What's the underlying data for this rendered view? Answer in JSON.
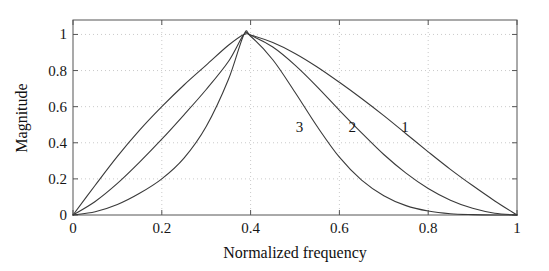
{
  "chart_data": {
    "type": "line",
    "title": "",
    "xlabel": "Normalized frequency",
    "ylabel": "Magnitude",
    "xlim": [
      0,
      1
    ],
    "ylim": [
      0,
      1.08
    ],
    "xticks": [
      "0",
      "0.2",
      "0.4",
      "0.6",
      "0.8",
      "1"
    ],
    "xtick_values": [
      0,
      0.2,
      0.4,
      0.6,
      0.8,
      1
    ],
    "yticks": [
      "0",
      "0.2",
      "0.4",
      "0.6",
      "0.8",
      "1"
    ],
    "ytick_values": [
      0,
      0.2,
      0.4,
      0.6,
      0.8,
      1
    ],
    "grid": true,
    "grid_style": "dotted",
    "legend": "inline curve annotations",
    "line_color": "#3a3a3a",
    "peak_frequency": 0.385,
    "peak_magnitude": 1.0,
    "x": [
      0,
      0.05,
      0.1,
      0.15,
      0.2,
      0.25,
      0.3,
      0.35,
      0.385,
      0.4,
      0.45,
      0.5,
      0.55,
      0.6,
      0.65,
      0.7,
      0.75,
      0.8,
      0.85,
      0.9,
      0.95,
      1
    ],
    "series": [
      {
        "name": "1",
        "label": "1",
        "label_x": 0.748,
        "label_y": 0.487,
        "values": [
          0.0,
          0.165,
          0.325,
          0.47,
          0.6,
          0.72,
          0.83,
          0.94,
          1.0,
          0.997,
          0.955,
          0.895,
          0.82,
          0.735,
          0.645,
          0.55,
          0.45,
          0.35,
          0.253,
          0.163,
          0.078,
          0.0
        ]
      },
      {
        "name": "2",
        "label": "2",
        "label_x": 0.629,
        "label_y": 0.487,
        "values": [
          0.0,
          0.075,
          0.175,
          0.293,
          0.42,
          0.555,
          0.695,
          0.85,
          1.0,
          0.995,
          0.93,
          0.83,
          0.71,
          0.58,
          0.455,
          0.335,
          0.232,
          0.147,
          0.082,
          0.037,
          0.01,
          0.0
        ]
      },
      {
        "name": "3",
        "label": "3",
        "label_x": 0.51,
        "label_y": 0.487,
        "values": [
          0.0,
          0.018,
          0.058,
          0.12,
          0.2,
          0.315,
          0.49,
          0.75,
          1.0,
          0.99,
          0.86,
          0.68,
          0.49,
          0.32,
          0.193,
          0.107,
          0.052,
          0.022,
          0.007,
          0.002,
          0.0,
          0.0
        ]
      }
    ]
  },
  "axes": {
    "left_px": 73,
    "right_px": 517,
    "top_px": 20,
    "bottom_px": 215,
    "box_color": "#555555",
    "grid_color": "#bdbdbd"
  }
}
